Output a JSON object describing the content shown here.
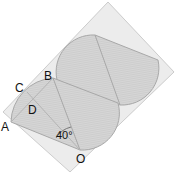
{
  "diagram": {
    "type": "geometry",
    "labels": {
      "A": "A",
      "B": "B",
      "C": "C",
      "D": "D",
      "O": "O",
      "angle": "40°"
    },
    "colors": {
      "rectangle_fill": "#ececec",
      "rectangle_stroke": "#c8c8c8",
      "shape_fill": "#d4d4d4",
      "shape_stroke": "#a8a8a8",
      "hatch": "#c2c2c2",
      "text": "#111111"
    }
  }
}
